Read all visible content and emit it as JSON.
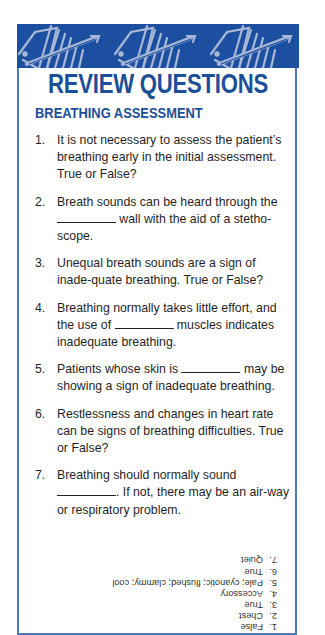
{
  "header": {
    "title": "REVIEW QUESTIONS",
    "section": "BREATHING ASSESSMENT"
  },
  "colors": {
    "brand_blue": "#1c4f9f",
    "banner_pattern": "#a9b8d8",
    "border": "#4f78b8",
    "text": "#1f1f1f"
  },
  "questions": [
    {
      "num": "1.",
      "text": "It is not necessary to assess the patient’s breathing early in the initial assessment. True or False?"
    },
    {
      "num": "2.",
      "pre": "Breath sounds can be heard through the ",
      "blank": "__________",
      "post": " wall with the aid of a stetho-scope."
    },
    {
      "num": "3.",
      "text": "Unequal breath sounds are a sign of inade-quate breathing. True or False?"
    },
    {
      "num": "4.",
      "pre": "Breathing normally takes little effort, and the use of ",
      "blank": "__________",
      "post": " muscles indicates inadequate breathing."
    },
    {
      "num": "5.",
      "pre": "Patients whose skin is ",
      "blank": "__________",
      "post": " may be showing a sign of inadequate breathing."
    },
    {
      "num": "6.",
      "text": "Restlessness and changes in heart rate can be signs of breathing difficulties. True or False?"
    },
    {
      "num": "7.",
      "pre": "Breathing should normally sound ",
      "blank": "__________",
      "post": ". If not, there may be an air-way or respiratory problem."
    }
  ],
  "answers": {
    "orientation": "upside-down",
    "items": [
      {
        "num": "1.",
        "text": "False"
      },
      {
        "num": "2.",
        "text": "Chest"
      },
      {
        "num": "3.",
        "text": "True"
      },
      {
        "num": "4.",
        "text": "Accessory"
      },
      {
        "num": "5.",
        "text": "Pale; cyanotic; flushed; clammy; cool"
      },
      {
        "num": "6.",
        "text": "True"
      },
      {
        "num": "7.",
        "text": "Quiet"
      }
    ]
  }
}
